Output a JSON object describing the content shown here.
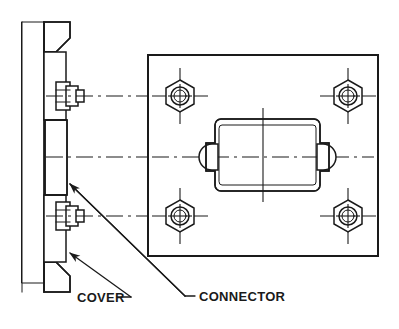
{
  "drawing": {
    "title": "Connector Cover Assembly Detail",
    "background_color": "#ffffff",
    "line_color": "#1a1a1a",
    "labels": {
      "cover": "COVER",
      "connector": "CONNECTOR"
    },
    "views": {
      "section_view": {
        "name": "left-section-view",
        "description": "Cross-section of bulkhead wall with cover flange, bolts and connector gasket"
      },
      "front_view": {
        "name": "right-front-view",
        "description": "Front elevation of rectangular cover plate with four corner hex nuts and central connector"
      }
    },
    "fasteners": {
      "count": 4,
      "type": "hex-nut",
      "positions": [
        {
          "label": "top-left",
          "cx": 180,
          "cy": 96
        },
        {
          "label": "top-right",
          "cx": 348,
          "cy": 96
        },
        {
          "label": "bottom-left",
          "cx": 180,
          "cy": 216
        },
        {
          "label": "bottom-right",
          "cx": 348,
          "cy": 216
        }
      ]
    },
    "plate": {
      "x": 148,
      "y": 55,
      "width": 230,
      "height": 201
    },
    "connector_body": {
      "x": 209,
      "y": 119,
      "width": 117,
      "height": 72,
      "fill_pattern": "stipple"
    },
    "centerlines": {
      "horizontal_main_y": 157,
      "upper_bolt_y": 96,
      "lower_bolt_y": 216,
      "vertical_x": 263
    }
  }
}
